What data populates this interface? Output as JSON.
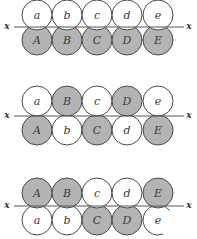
{
  "figure": {
    "colors": {
      "shaded": "#b4b4b4",
      "white": "#ffffff",
      "stroke": "#4a4a4a"
    },
    "axis_label": "x",
    "panels": [
      {
        "top": [
          {
            "label": "a",
            "shaded": false
          },
          {
            "label": "b",
            "shaded": false
          },
          {
            "label": "c",
            "shaded": false
          },
          {
            "label": "d",
            "shaded": false
          },
          {
            "label": "e",
            "shaded": false
          }
        ],
        "bottom": [
          {
            "label": "A",
            "shaded": true
          },
          {
            "label": "B",
            "shaded": true
          },
          {
            "label": "C",
            "shaded": true
          },
          {
            "label": "D",
            "shaded": true
          },
          {
            "label": "E",
            "shaded": true
          }
        ]
      },
      {
        "top": [
          {
            "label": "a",
            "shaded": false
          },
          {
            "label": "B",
            "shaded": true
          },
          {
            "label": "c",
            "shaded": false
          },
          {
            "label": "D",
            "shaded": true
          },
          {
            "label": "e",
            "shaded": false
          }
        ],
        "bottom": [
          {
            "label": "A",
            "shaded": true
          },
          {
            "label": "b",
            "shaded": false
          },
          {
            "label": "C",
            "shaded": true
          },
          {
            "label": "d",
            "shaded": false
          },
          {
            "label": "E",
            "shaded": true
          }
        ]
      },
      {
        "top": [
          {
            "label": "A",
            "shaded": true
          },
          {
            "label": "B",
            "shaded": true
          },
          {
            "label": "c",
            "shaded": false
          },
          {
            "label": "d",
            "shaded": false
          },
          {
            "label": "E",
            "shaded": true
          }
        ],
        "bottom": [
          {
            "label": "a",
            "shaded": false
          },
          {
            "label": "b",
            "shaded": false
          },
          {
            "label": "C",
            "shaded": true
          },
          {
            "label": "D",
            "shaded": true
          },
          {
            "label": "e",
            "shaded": false,
            "open": true
          }
        ]
      }
    ]
  }
}
